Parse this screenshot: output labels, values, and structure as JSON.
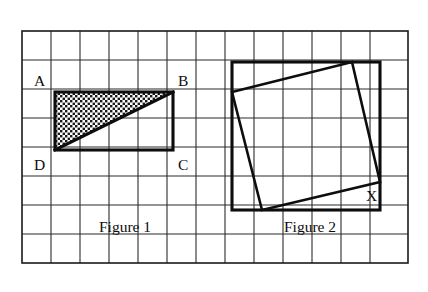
{
  "page": {
    "background_color": "#ffffff",
    "width": 428,
    "height": 292
  },
  "grid": {
    "columns": 13,
    "rows": 8,
    "cell_size": 29,
    "origin_x": 22,
    "origin_y": 31,
    "line_color": "#2b2b2b",
    "border_color": "#1a1a1a"
  },
  "figure1": {
    "caption": "Figure 1",
    "caption_x": 125,
    "caption_y": 232,
    "rectangle": {
      "x": 55,
      "y": 92,
      "width": 118,
      "height": 58,
      "cells_wide": 4,
      "cells_tall": 2
    },
    "diagonal": {
      "from": "D",
      "to": "B"
    },
    "shaded_region": {
      "fill": "checkered-dot-pattern",
      "fill_color": "#1a1a1a",
      "description": "upper-left triangle ABD shaded"
    },
    "vertices": [
      {
        "label": "A",
        "x": 34,
        "y": 86,
        "corner": "top-left"
      },
      {
        "label": "B",
        "x": 178,
        "y": 86,
        "corner": "top-right"
      },
      {
        "label": "C",
        "x": 178,
        "y": 170,
        "corner": "bottom-right"
      },
      {
        "label": "D",
        "x": 34,
        "y": 170,
        "corner": "bottom-left"
      }
    ]
  },
  "figure2": {
    "caption": "Figure 2",
    "caption_x": 310,
    "caption_y": 232,
    "outer_square": {
      "x": 232,
      "y": 62,
      "size": 148,
      "cells": 5
    },
    "inscribed_square": {
      "points": "232,92 352,62 380,182 262,210",
      "vertices": [
        {
          "x": 232,
          "y": 92
        },
        {
          "x": 352,
          "y": 62
        },
        {
          "x": 380,
          "y": 182
        },
        {
          "x": 262,
          "y": 210
        }
      ]
    },
    "vertices": [
      {
        "label": "X",
        "x": 366,
        "y": 201
      }
    ]
  }
}
